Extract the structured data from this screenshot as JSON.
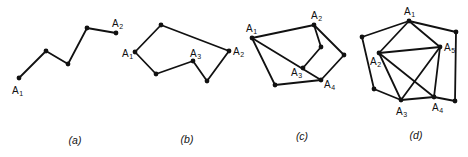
{
  "panels": [
    {
      "id": "a",
      "caption": "(a)",
      "caption_pos": [
        75,
        144
      ],
      "vertices": [
        [
          19,
          78
        ],
        [
          46,
          51
        ],
        [
          68,
          64
        ],
        [
          87,
          28
        ],
        [
          116,
          33
        ]
      ],
      "edges": [
        [
          0,
          1
        ],
        [
          1,
          2
        ],
        [
          2,
          3
        ],
        [
          3,
          4
        ]
      ],
      "labels": [
        {
          "text": "A",
          "sub": "1",
          "x": 12,
          "y": 94
        },
        {
          "text": "A",
          "sub": "2",
          "x": 112,
          "y": 27
        }
      ]
    },
    {
      "id": "b",
      "caption": "(b)",
      "caption_pos": [
        187,
        143
      ],
      "vertices": [
        [
          135,
          52
        ],
        [
          161,
          25
        ],
        [
          229,
          51
        ],
        [
          207,
          81
        ],
        [
          193,
          61
        ],
        [
          156,
          74
        ]
      ],
      "edges": [
        [
          0,
          1
        ],
        [
          1,
          2
        ],
        [
          2,
          3
        ],
        [
          3,
          4
        ],
        [
          4,
          5
        ],
        [
          5,
          0
        ]
      ],
      "labels": [
        {
          "text": "A",
          "sub": "1",
          "x": 122,
          "y": 57
        },
        {
          "text": "A",
          "sub": "2",
          "x": 233,
          "y": 55
        },
        {
          "text": "A",
          "sub": "3",
          "x": 190,
          "y": 57
        }
      ]
    },
    {
      "id": "c",
      "caption": "(c)",
      "caption_pos": [
        302,
        140
      ],
      "vertices": [
        [
          252,
          38
        ],
        [
          314,
          25
        ],
        [
          321,
          47
        ],
        [
          344,
          55
        ],
        [
          321,
          80
        ],
        [
          303,
          68
        ],
        [
          275,
          85
        ]
      ],
      "edges": [
        [
          0,
          1
        ],
        [
          1,
          3
        ],
        [
          3,
          4
        ],
        [
          4,
          6
        ],
        [
          6,
          0
        ],
        [
          0,
          4
        ],
        [
          1,
          2
        ],
        [
          2,
          5
        ]
      ],
      "labels": [
        {
          "text": "A",
          "sub": "1",
          "x": 246,
          "y": 32
        },
        {
          "text": "A",
          "sub": "2",
          "x": 311,
          "y": 19
        },
        {
          "text": "A",
          "sub": "3",
          "x": 291,
          "y": 76
        },
        {
          "text": "A",
          "sub": "4",
          "x": 324,
          "y": 88
        }
      ]
    },
    {
      "id": "d",
      "caption": "(d)",
      "caption_pos": [
        416,
        139
      ],
      "vertices": [
        [
          409,
          21
        ],
        [
          362,
          37
        ],
        [
          379,
          53
        ],
        [
          374,
          89
        ],
        [
          401,
          100
        ],
        [
          434,
          97
        ],
        [
          455,
          101
        ],
        [
          456,
          32
        ],
        [
          440,
          47
        ]
      ],
      "edges": [
        [
          0,
          1
        ],
        [
          1,
          3
        ],
        [
          3,
          4
        ],
        [
          4,
          5
        ],
        [
          5,
          6
        ],
        [
          6,
          7
        ],
        [
          7,
          0
        ],
        [
          0,
          2
        ],
        [
          0,
          8
        ],
        [
          2,
          8
        ],
        [
          2,
          4
        ],
        [
          2,
          5
        ],
        [
          4,
          8
        ],
        [
          8,
          5
        ]
      ],
      "labels": [
        {
          "text": "A",
          "sub": "1",
          "x": 404,
          "y": 15
        },
        {
          "text": "A",
          "sub": "2",
          "x": 370,
          "y": 65
        },
        {
          "text": "A",
          "sub": "3",
          "x": 396,
          "y": 115
        },
        {
          "text": "A",
          "sub": "4",
          "x": 432,
          "y": 111
        },
        {
          "text": "A",
          "sub": "5",
          "x": 444,
          "y": 51
        }
      ]
    }
  ]
}
